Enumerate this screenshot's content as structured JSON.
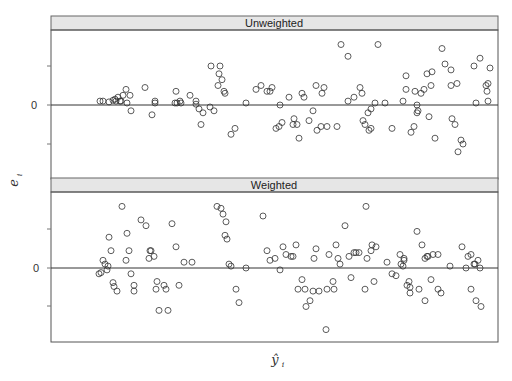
{
  "chart_data": {
    "type": "scatter",
    "layout": "two stacked panels (lattice-style), shared x-axis",
    "xlabel": "ŷ_i",
    "ylabel": "e_i",
    "grid": false,
    "legend": null,
    "y_tick_labels": [
      "0"
    ],
    "x_tick_labels": [],
    "reference_line": 0,
    "units_note": "x = fitted-value horizontal position (px within panel, 0–447); y = residual in tick units (1 unit = spacing between y ticks)",
    "panels": [
      {
        "name": "Unweighted",
        "ylim": [
          -1.9,
          1.9
        ],
        "points": [
          [
            49,
            0.1
          ],
          [
            52,
            0.1
          ],
          [
            58,
            0.08
          ],
          [
            62,
            0.12
          ],
          [
            64,
            0.15
          ],
          [
            65,
            0.1
          ],
          [
            67,
            0.2
          ],
          [
            69,
            0.1
          ],
          [
            70,
            0.1
          ],
          [
            72,
            0.25
          ],
          [
            75,
            0.4
          ],
          [
            76,
            0.05
          ],
          [
            79,
            0.25
          ],
          [
            80,
            -0.15
          ],
          [
            94,
            0.45
          ],
          [
            101,
            -0.25
          ],
          [
            104,
            0.05
          ],
          [
            104,
            0.1
          ],
          [
            124,
            0.05
          ],
          [
            125,
            0.35
          ],
          [
            126,
            0.05
          ],
          [
            129,
            0.1
          ],
          [
            130,
            0.05
          ],
          [
            139,
            0.25
          ],
          [
            145,
            0.1
          ],
          [
            145,
            0.02
          ],
          [
            148,
            -0.1
          ],
          [
            150,
            -0.5
          ],
          [
            152,
            -0.2
          ],
          [
            159,
            -0.05
          ],
          [
            160,
            1.0
          ],
          [
            163,
            -0.15
          ],
          [
            167,
            0.5
          ],
          [
            168,
            0.8
          ],
          [
            169,
            1.0
          ],
          [
            171,
            0.65
          ],
          [
            173,
            0.35
          ],
          [
            174,
            0.3
          ],
          [
            180,
            -0.75
          ],
          [
            184,
            -0.6
          ],
          [
            195,
            0.05
          ],
          [
            205,
            0.4
          ],
          [
            210,
            0.5
          ],
          [
            216,
            0.35
          ],
          [
            219,
            0.35
          ],
          [
            221,
            0.45
          ],
          [
            225,
            -0.6
          ],
          [
            228,
            -0.55
          ],
          [
            231,
            -0.45
          ],
          [
            229,
            0.0
          ],
          [
            238,
            0.2
          ],
          [
            242,
            -0.5
          ],
          [
            243,
            -0.35
          ],
          [
            246,
            -0.5
          ],
          [
            248,
            -0.85
          ],
          [
            251,
            0.3
          ],
          [
            253,
            0.2
          ],
          [
            258,
            -0.4
          ],
          [
            262,
            -0.15
          ],
          [
            265,
            0.5
          ],
          [
            266,
            -0.65
          ],
          [
            270,
            -0.55
          ],
          [
            271,
            0.3
          ],
          [
            273,
            0.45
          ],
          [
            276,
            -0.55
          ],
          [
            286,
            -0.55
          ],
          [
            290,
            1.55
          ],
          [
            297,
            0.1
          ],
          [
            297,
            1.25
          ],
          [
            303,
            0.2
          ],
          [
            309,
            0.45
          ],
          [
            311,
            0.3
          ],
          [
            312,
            -0.4
          ],
          [
            314,
            -0.5
          ],
          [
            317,
            -0.2
          ],
          [
            318,
            -0.65
          ],
          [
            320,
            -0.6
          ],
          [
            320,
            -0.1
          ],
          [
            324,
            0.05
          ],
          [
            327,
            1.55
          ],
          [
            334,
            0.05
          ],
          [
            341,
            -0.6
          ],
          [
            352,
            0.1
          ],
          [
            355,
            0.75
          ],
          [
            355,
            0.4
          ],
          [
            360,
            -0.7
          ],
          [
            363,
            -0.55
          ],
          [
            364,
            0.35
          ],
          [
            366,
            0.0
          ],
          [
            366,
            -0.2
          ],
          [
            367,
            -0.15
          ],
          [
            370,
            0.3
          ],
          [
            373,
            0.4
          ],
          [
            376,
            0.8
          ],
          [
            378,
            -0.3
          ],
          [
            380,
            0.5
          ],
          [
            381,
            0.85
          ],
          [
            384,
            -0.85
          ],
          [
            391,
            1.45
          ],
          [
            394,
            1.05
          ],
          [
            400,
            0.5
          ],
          [
            400,
            0.9
          ],
          [
            401,
            -0.35
          ],
          [
            404,
            -0.5
          ],
          [
            406,
            0.55
          ],
          [
            407,
            -1.2
          ],
          [
            410,
            -0.9
          ],
          [
            412,
            -1.0
          ],
          [
            423,
            1.0
          ],
          [
            425,
            0.05
          ],
          [
            429,
            1.2
          ],
          [
            435,
            0.5
          ],
          [
            436,
            0.35
          ],
          [
            437,
            0.55
          ],
          [
            437,
            0.1
          ],
          [
            439,
            0.95
          ]
        ]
      },
      {
        "name": "Weighted",
        "ylim": [
          -1.9,
          1.9
        ],
        "points": [
          [
            48,
            -0.15
          ],
          [
            50,
            -0.12
          ],
          [
            52,
            0.2
          ],
          [
            54,
            0.1
          ],
          [
            56,
            -0.05
          ],
          [
            57,
            0.05
          ],
          [
            58,
            0.8
          ],
          [
            60,
            0.45
          ],
          [
            62,
            -0.38
          ],
          [
            63,
            -0.48
          ],
          [
            66,
            -0.6
          ],
          [
            71,
            1.6
          ],
          [
            75,
            0.2
          ],
          [
            76,
            0.9
          ],
          [
            78,
            0.45
          ],
          [
            80,
            -0.15
          ],
          [
            83,
            -0.6
          ],
          [
            83,
            -0.45
          ],
          [
            90,
            1.25
          ],
          [
            95,
            1.1
          ],
          [
            98,
            0.25
          ],
          [
            99,
            0.45
          ],
          [
            100,
            0.45
          ],
          [
            103,
            0.3
          ],
          [
            105,
            -0.55
          ],
          [
            106,
            -0.35
          ],
          [
            108,
            -1.1
          ],
          [
            113,
            -0.45
          ],
          [
            115,
            -0.55
          ],
          [
            117,
            -1.1
          ],
          [
            121,
            1.15
          ],
          [
            125,
            0.55
          ],
          [
            128,
            -0.45
          ],
          [
            133,
            0.15
          ],
          [
            141,
            0.15
          ],
          [
            166,
            1.6
          ],
          [
            170,
            1.55
          ],
          [
            172,
            1.4
          ],
          [
            175,
            1.2
          ],
          [
            174,
            0.85
          ],
          [
            176,
            0.75
          ],
          [
            178,
            0.1
          ],
          [
            180,
            0.05
          ],
          [
            185,
            -0.55
          ],
          [
            188,
            -0.9
          ],
          [
            195,
            0.0
          ],
          [
            212,
            1.35
          ],
          [
            216,
            0.45
          ],
          [
            219,
            0.2
          ],
          [
            224,
            0.25
          ],
          [
            229,
            -0.05
          ],
          [
            232,
            0.55
          ],
          [
            235,
            0.35
          ],
          [
            240,
            0.3
          ],
          [
            242,
            0.3
          ],
          [
            245,
            0.6
          ],
          [
            247,
            -0.55
          ],
          [
            251,
            -0.3
          ],
          [
            254,
            -0.55
          ],
          [
            255,
            -1.0
          ],
          [
            259,
            -0.85
          ],
          [
            262,
            -0.6
          ],
          [
            263,
            0.25
          ],
          [
            265,
            0.5
          ],
          [
            268,
            -0.6
          ],
          [
            276,
            -0.55
          ],
          [
            275,
            -1.6
          ],
          [
            278,
            0.35
          ],
          [
            282,
            -0.35
          ],
          [
            283,
            -0.55
          ],
          [
            285,
            0.6
          ],
          [
            287,
            0.25
          ],
          [
            289,
            0.1
          ],
          [
            294,
            1.1
          ],
          [
            298,
            0.3
          ],
          [
            300,
            -0.25
          ],
          [
            303,
            0.4
          ],
          [
            305,
            0.4
          ],
          [
            308,
            0.4
          ],
          [
            314,
            -0.55
          ],
          [
            315,
            1.6
          ],
          [
            316,
            0.25
          ],
          [
            321,
            0.6
          ],
          [
            320,
            0.45
          ],
          [
            323,
            -0.35
          ],
          [
            325,
            0.55
          ],
          [
            336,
            0.15
          ],
          [
            341,
            -0.15
          ],
          [
            345,
            -0.2
          ],
          [
            349,
            0.35
          ],
          [
            350,
            0.1
          ],
          [
            352,
            0.05
          ],
          [
            353,
            0.2
          ],
          [
            353,
            0.25
          ],
          [
            356,
            -0.45
          ],
          [
            358,
            -0.35
          ],
          [
            359,
            -0.5
          ],
          [
            359,
            -0.65
          ],
          [
            366,
            0.95
          ],
          [
            368,
            -0.55
          ],
          [
            371,
            0.6
          ],
          [
            374,
            0.25
          ],
          [
            374,
            -0.85
          ],
          [
            376,
            0.3
          ],
          [
            377,
            0.3
          ],
          [
            380,
            -0.3
          ],
          [
            382,
            0.35
          ],
          [
            387,
            0.35
          ],
          [
            387,
            -0.55
          ],
          [
            390,
            -0.65
          ],
          [
            399,
            0.05
          ],
          [
            411,
            0.55
          ],
          [
            415,
            0.0
          ],
          [
            417,
            0.3
          ],
          [
            420,
            0.35
          ],
          [
            420,
            -0.55
          ],
          [
            423,
            0.1
          ],
          [
            424,
            0.1
          ],
          [
            427,
            0.2
          ],
          [
            429,
            0.0
          ],
          [
            425,
            -0.85
          ],
          [
            430,
            -1.0
          ]
        ]
      }
    ]
  },
  "panels": {
    "upper": {
      "strip_label": "Unweighted",
      "zero_label": "0"
    },
    "lower": {
      "strip_label": "Weighted",
      "zero_label": "0"
    }
  },
  "axes": {
    "ylabel_main": "e",
    "ylabel_sub": "i",
    "xlabel_main": "ŷ",
    "xlabel_sub": "i"
  },
  "colors": {
    "strip_fill": "#e6e6e6",
    "frame": "#555555",
    "point_stroke": "#333333",
    "zero_line": "#333333"
  }
}
